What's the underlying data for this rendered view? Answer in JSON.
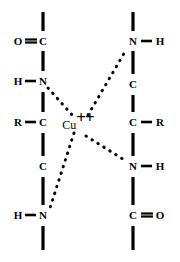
{
  "figure": {
    "background_color": "#ffffff",
    "ink_color": "#000000",
    "width": 180,
    "height": 262
  },
  "metal_center": {
    "symbol": "Cu",
    "charge": "++",
    "x": 78,
    "y": 124
  },
  "atoms": [
    {
      "id": "L-O-top",
      "label": "O",
      "x": 18,
      "y": 41
    },
    {
      "id": "L-C-top",
      "label": "C",
      "x": 43,
      "y": 41
    },
    {
      "id": "L-H-up",
      "label": "H",
      "x": 18,
      "y": 81
    },
    {
      "id": "L-N-up",
      "label": "N",
      "x": 43,
      "y": 81
    },
    {
      "id": "L-R",
      "label": "R",
      "x": 18,
      "y": 122
    },
    {
      "id": "L-C-mid",
      "label": "C",
      "x": 43,
      "y": 122
    },
    {
      "id": "L-C-low",
      "label": "C",
      "x": 43,
      "y": 166
    },
    {
      "id": "L-H-low",
      "label": "H",
      "x": 18,
      "y": 215
    },
    {
      "id": "L-N-low",
      "label": "N",
      "x": 43,
      "y": 215
    },
    {
      "id": "R-N-top",
      "label": "N",
      "x": 133,
      "y": 41
    },
    {
      "id": "R-H-top",
      "label": "H",
      "x": 160,
      "y": 41
    },
    {
      "id": "R-C-up",
      "label": "C",
      "x": 133,
      "y": 84
    },
    {
      "id": "R-C-mid",
      "label": "C",
      "x": 133,
      "y": 122
    },
    {
      "id": "R-R",
      "label": "R",
      "x": 160,
      "y": 122
    },
    {
      "id": "R-N-low",
      "label": "N",
      "x": 133,
      "y": 166
    },
    {
      "id": "R-H-low",
      "label": "H",
      "x": 160,
      "y": 166
    },
    {
      "id": "R-C-low",
      "label": "C",
      "x": 133,
      "y": 215
    },
    {
      "id": "R-O-low",
      "label": "O",
      "x": 160,
      "y": 215
    }
  ],
  "bonds": {
    "vertical": [
      {
        "id": "L-term-top",
        "x": 43,
        "y1": 12,
        "y2": 31
      },
      {
        "id": "L-C-N",
        "x": 43,
        "y1": 51,
        "y2": 71
      },
      {
        "id": "L-N-C",
        "x": 43,
        "y1": 92,
        "y2": 112
      },
      {
        "id": "L-C-C",
        "x": 43,
        "y1": 133,
        "y2": 156
      },
      {
        "id": "L-C-N2",
        "x": 43,
        "y1": 177,
        "y2": 205
      },
      {
        "id": "L-term-bot",
        "x": 43,
        "y1": 226,
        "y2": 250
      },
      {
        "id": "R-term-top",
        "x": 133,
        "y1": 12,
        "y2": 31
      },
      {
        "id": "R-N-C",
        "x": 133,
        "y1": 51,
        "y2": 74
      },
      {
        "id": "R-C-C",
        "x": 133,
        "y1": 95,
        "y2": 112
      },
      {
        "id": "R-C-N",
        "x": 133,
        "y1": 133,
        "y2": 156
      },
      {
        "id": "R-N-C2",
        "x": 133,
        "y1": 177,
        "y2": 205
      },
      {
        "id": "R-term-bot",
        "x": 133,
        "y1": 226,
        "y2": 250
      }
    ],
    "single_horizontal": [
      {
        "id": "L-H-N",
        "x1": 25,
        "x2": 36,
        "y": 81
      },
      {
        "id": "L-R-C",
        "x1": 25,
        "x2": 36,
        "y": 122
      },
      {
        "id": "L-H-N2",
        "x1": 25,
        "x2": 36,
        "y": 215
      },
      {
        "id": "R-N-H",
        "x1": 141,
        "x2": 152,
        "y": 41
      },
      {
        "id": "R-C-R",
        "x1": 141,
        "x2": 152,
        "y": 122
      },
      {
        "id": "R-N-H2",
        "x1": 141,
        "x2": 152,
        "y": 166
      }
    ],
    "double_horizontal": [
      {
        "id": "L-O-eq-C",
        "x1": 25,
        "x2": 37,
        "y": 41,
        "gap": 3
      },
      {
        "id": "R-C-eq-O",
        "x1": 141,
        "x2": 153,
        "y": 215,
        "gap": 3
      }
    ],
    "coordination_dashed": [
      {
        "id": "coord-N-upper-left",
        "x1": 48,
        "y1": 88,
        "x2": 74,
        "y2": 117,
        "from": "L-N-up",
        "to": "Cu"
      },
      {
        "id": "coord-N-upper-right",
        "x1": 88,
        "y1": 115,
        "x2": 126,
        "y2": 50,
        "from": "Cu",
        "to": "R-N-top"
      },
      {
        "id": "coord-N-lower-left",
        "x1": 74,
        "y1": 133,
        "x2": 50,
        "y2": 208,
        "from": "Cu",
        "to": "L-N-low"
      },
      {
        "id": "coord-N-lower-right",
        "x1": 86,
        "y1": 136,
        "x2": 126,
        "y2": 161,
        "from": "Cu",
        "to": "R-N-low"
      }
    ]
  }
}
